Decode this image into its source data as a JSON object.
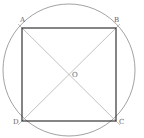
{
  "diagram": {
    "colors": {
      "circle": "#8a8a8a",
      "square": "#222222",
      "diagonal": "#a8a8a8",
      "label": "#666666"
    },
    "circle": {
      "cx": 69,
      "cy": 70,
      "r": 66
    },
    "points": {
      "A": {
        "label": "A",
        "x": 22,
        "y": 28
      },
      "B": {
        "label": "B",
        "x": 116,
        "y": 28
      },
      "C": {
        "label": "C",
        "x": 116,
        "y": 121
      },
      "D": {
        "label": "D",
        "x": 22,
        "y": 121
      },
      "O": {
        "label": "O",
        "x": 69,
        "y": 74
      }
    },
    "segments": [
      "AB",
      "BC",
      "CD",
      "DA",
      "AC",
      "BD"
    ]
  }
}
